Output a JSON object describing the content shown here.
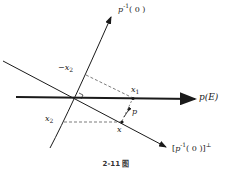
{
  "diagram": {
    "caption": "2-11 图",
    "labels": {
      "kernel_axis": {
        "base": "p",
        "sup": "-1",
        "arg": "( 0 )"
      },
      "image_axis": "p(E)",
      "perp_axis": {
        "open": "[",
        "base": "p",
        "sup": "-1",
        "arg": "( 0 )",
        "close": "]",
        "perp": "⊥"
      },
      "x1": {
        "base": "x",
        "sub": "1"
      },
      "neg_x2": {
        "base": "−x",
        "sub": "2"
      },
      "x2": {
        "base": "x",
        "sub": "2"
      },
      "x": "x",
      "p": "p"
    },
    "colors": {
      "line": "#1a1a1a",
      "dashed": "#444444",
      "background": "#ffffff"
    }
  }
}
